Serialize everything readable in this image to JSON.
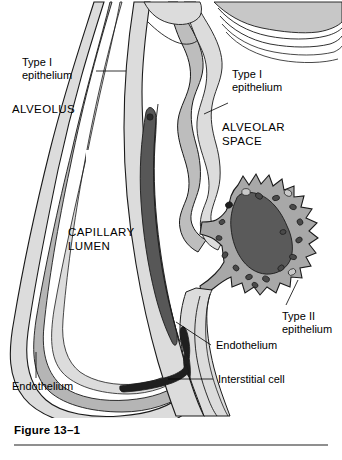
{
  "figure": {
    "caption": "Figure 13–1"
  },
  "labels": {
    "type_i_left": {
      "line1": "Type I",
      "line2": "epithelium"
    },
    "type_i_right": {
      "line1": "Type I",
      "line2": "epithelium"
    },
    "alveolus": "ALVEOLUS",
    "alveolar_space": {
      "line1": "ALVEOLAR",
      "line2": "SPACE"
    },
    "capillary_lumen": {
      "line1": "CAPILLARY",
      "line2": "LUMEN"
    },
    "type_ii": {
      "line1": "Type II",
      "line2": "epithelium"
    },
    "endothelium_right": "Endothelium",
    "endothelium_left": "Endothelium",
    "interstitial_cell": "Interstitial cell"
  },
  "colors": {
    "background": "#ffffff",
    "outline": "#1a1a1a",
    "tissue_light": "#dcdcdc",
    "tissue_mid": "#bdbdbd",
    "cytoplasm": "#a8a8a8",
    "nucleus_dark": "#5a5a5a",
    "erythrocyte": "#575757",
    "lumen_white": "#ffffff",
    "rule": "#8f8f8f"
  },
  "structures": [
    {
      "name": "alveolar-wall-left",
      "description": "Layered alveolar wall on the left forming the alveolus boundary"
    },
    {
      "name": "capillary-lumen",
      "description": "Open white capillary lumen in the center"
    },
    {
      "name": "erythrocyte",
      "description": "Dark elongated red blood cell inside the capillary"
    },
    {
      "name": "endothelium-layer",
      "description": "Thin endothelial lining of the capillary"
    },
    {
      "name": "type-i-epithelium-layer",
      "description": "Thin squamous epithelial lining of the alveolus"
    },
    {
      "name": "type-ii-epithelium-cell",
      "description": "Large rounded cell with microvilli, nucleus and lamellar bodies"
    },
    {
      "name": "interstitial-cell",
      "description": "Dark slender cell within the interstitial space at the base"
    },
    {
      "name": "alveolar-space",
      "description": "Air space of the alveolus on the right"
    }
  ]
}
